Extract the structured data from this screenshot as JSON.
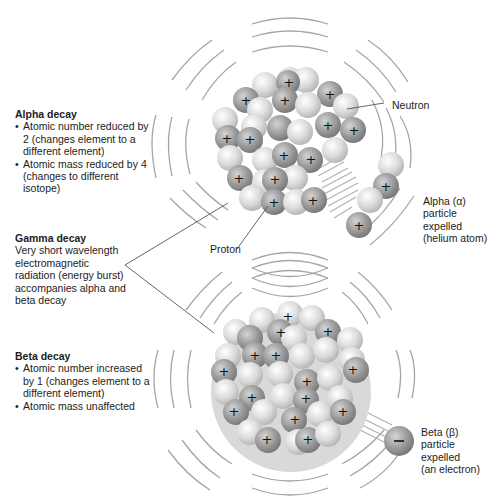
{
  "alpha": {
    "title": "Alpha decay",
    "bullets": [
      "Atomic number reduced by 2 (changes element to a different element)",
      "Atomic mass reduced by 4 (changes to different isotope)"
    ],
    "particle_label": [
      "Alpha (α)",
      "particle",
      "expelled",
      "(helium atom)"
    ]
  },
  "gamma": {
    "title": "Gamma decay",
    "description": "Very short wavelength electromagnetic radiation (energy burst) accompanies alpha and beta decay"
  },
  "beta": {
    "title": "Beta decay",
    "bullets": [
      "Atomic number increased by 1 (changes element to a different element)",
      "Atomic mass unaffected"
    ],
    "particle_label": [
      "Beta (β)",
      "particle",
      "expelled",
      "(an electron)"
    ]
  },
  "callouts": {
    "neutron": "Neutron",
    "proton": "Proton"
  },
  "symbols": {
    "plus": "+",
    "minus": "–"
  },
  "colors": {
    "proton": "#8e8e8e",
    "neutron": "#d6d6d6",
    "lines": "#9a9a9a",
    "text": "#1c1c1c"
  }
}
